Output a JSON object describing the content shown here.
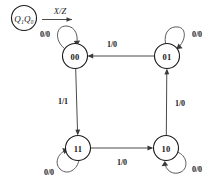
{
  "diagram": {
    "type": "mealy-state-machine",
    "legend": {
      "state_notation": "Q₁Q₀",
      "state_notation_base": "Q",
      "state_notation_sub1": "1",
      "state_notation_sub0": "0",
      "transition_notation": "X/Z"
    },
    "colors": {
      "background": "#ffffff",
      "node_stroke": "#1a1a1a",
      "edge_stroke": "#4a4a4a",
      "text": "#1a1a1a"
    },
    "states": [
      {
        "id": "s00",
        "label": "00",
        "cx": 75,
        "cy": 56,
        "r": 12.5
      },
      {
        "id": "s01",
        "label": "01",
        "cx": 167,
        "cy": 56,
        "r": 12.5
      },
      {
        "id": "s11",
        "label": "11",
        "cx": 78,
        "cy": 148,
        "r": 12.5
      },
      {
        "id": "s10",
        "label": "10",
        "cx": 166,
        "cy": 148,
        "r": 12.5
      }
    ],
    "self_loops": [
      {
        "id": "loop00",
        "state": "00",
        "label": "0/0",
        "label_x": 45,
        "label_y": 34,
        "position": "upper-left"
      },
      {
        "id": "loop01",
        "state": "01",
        "label": "0/0",
        "label_x": 197,
        "label_y": 34,
        "position": "upper-right"
      },
      {
        "id": "loop11",
        "state": "11",
        "label": "0/0",
        "label_x": 49,
        "label_y": 172,
        "position": "lower-left"
      },
      {
        "id": "loop10",
        "state": "10",
        "label": "0/0",
        "label_x": 197,
        "label_y": 169,
        "position": "lower-right"
      }
    ],
    "transitions": [
      {
        "id": "t01_00",
        "from": "01",
        "to": "00",
        "label": "1/0",
        "label_x": 112,
        "label_y": 44,
        "direction": "left"
      },
      {
        "id": "t00_11",
        "from": "00",
        "to": "11",
        "label": "1/1",
        "label_x": 63,
        "label_y": 101,
        "direction": "down"
      },
      {
        "id": "t11_10",
        "from": "11",
        "to": "10",
        "label": "1/0",
        "label_x": 122,
        "label_y": 162,
        "direction": "right"
      },
      {
        "id": "t10_01",
        "from": "10",
        "to": "01",
        "label": "1/0",
        "label_x": 180,
        "label_y": 103,
        "direction": "up"
      }
    ]
  }
}
